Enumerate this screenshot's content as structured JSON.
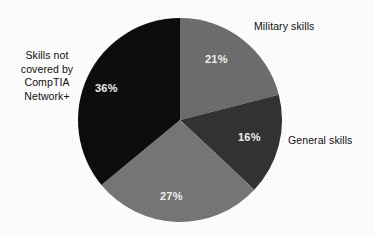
{
  "chart_data": {
    "type": "pie",
    "title": "",
    "subtitle": "",
    "xlabel": "",
    "ylabel": "",
    "legend_position": "none",
    "grid": false,
    "labels_outside": true,
    "start_angle_deg": 0,
    "direction": "clockwise",
    "categories": [
      "Military skills",
      "General skills",
      "",
      "Skills not covered by CompTIA Network+"
    ],
    "values": [
      21,
      27,
      16,
      36
    ],
    "unit": "%",
    "slices": [
      {
        "label": "Military skills",
        "value": 21,
        "value_text": "21%",
        "color": "#6e6e6e",
        "label_position": "outside-right-top",
        "value_text_color": "#f2f2f2"
      },
      {
        "label": "General skills",
        "value": 16,
        "value_text": "16%",
        "color": "#333333",
        "label_position": "outside-right",
        "value_text_color": "#f2f2f2"
      },
      {
        "label": "",
        "value": 27,
        "value_text": "27%",
        "color": "#777777",
        "label_position": "none",
        "value_text_color": "#f2f2f2"
      },
      {
        "label": "Skills not covered by CompTIA Network+",
        "label_lines": "Skills not\ncovered by\nCompTIA\nNetwork+",
        "value": 36,
        "value_text": "36%",
        "color": "#0d0d0d",
        "label_position": "outside-left",
        "value_text_color": "#f2f2f2"
      }
    ]
  },
  "figure": {
    "background": "#ffffff",
    "center_x": 180,
    "center_y": 120,
    "radius": 102
  },
  "labels": {
    "military": "Military skills",
    "general": "General skills",
    "not_covered": "Skills not\ncovered by\nCompTIA\nNetwork+"
  },
  "percents": {
    "military": "21%",
    "general": "16%",
    "other": "27%",
    "not_covered": "36%"
  }
}
